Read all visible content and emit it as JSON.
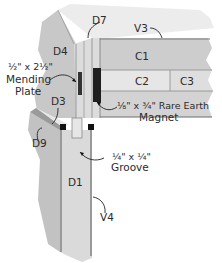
{
  "diagram": {
    "type": "woodworking joint cutaway",
    "parts": {
      "D7": "D7",
      "V3": "V3",
      "D4": "D4",
      "C1": "C1",
      "C2": "C2",
      "C3": "C3",
      "D3": "D3",
      "D9": "D9",
      "D1": "D1",
      "V4": "V4"
    },
    "callouts": {
      "mending_plate": [
        "½\" x 2½\"",
        "Mending",
        "Plate"
      ],
      "magnet": [
        "⅛\" x ¾\" Rare Earth",
        "Magnet"
      ],
      "groove": [
        "¼\" x ¼\"",
        "Groove"
      ]
    },
    "colors": {
      "light_face": "#e9e9e9",
      "mid_face": "#cfcfcf",
      "dark_face": "#b5b5b5",
      "edge": "#6f6f6f",
      "magnet": "#1e1e1e",
      "plate": "#3a3a3a"
    }
  }
}
